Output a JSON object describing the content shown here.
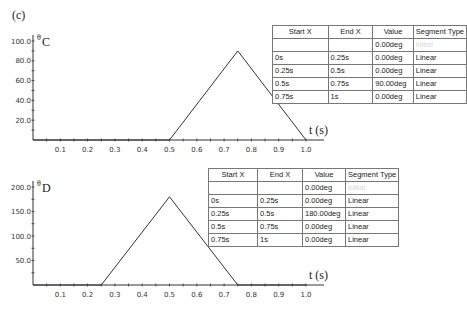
{
  "figure_label": "(c)",
  "charts": [
    {
      "id": "C",
      "y_symbol": "θ",
      "y_subscript": "C",
      "x_label": "t (s)",
      "table": {
        "headers": [
          "Start X",
          "End X",
          "Value",
          "Segment Type"
        ],
        "rows": [
          [
            "",
            "",
            "0.00deg",
            "initial"
          ],
          [
            "0s",
            "0.25s",
            "0.00deg",
            "Linear"
          ],
          [
            "0.25s",
            "0.5s",
            "0.00deg",
            "Linear"
          ],
          [
            "0.5s",
            "0.75s",
            "90.00deg",
            "Linear"
          ],
          [
            "0.75s",
            "1s",
            "0.00deg",
            "Linear"
          ]
        ]
      }
    },
    {
      "id": "D",
      "y_symbol": "θ",
      "y_subscript": "D",
      "x_label": "t (s)",
      "table": {
        "headers": [
          "Start X",
          "End X",
          "Value",
          "Segment Type"
        ],
        "rows": [
          [
            "",
            "",
            "0.00deg",
            "initial"
          ],
          [
            "0s",
            "0.25s",
            "0.00deg",
            "Linear"
          ],
          [
            "0.25s",
            "0.5s",
            "180.00deg",
            "Linear"
          ],
          [
            "0.5s",
            "0.75s",
            "0.00deg",
            "Linear"
          ],
          [
            "0.75s",
            "1s",
            "0.00deg",
            "Linear"
          ]
        ]
      }
    }
  ],
  "chart_data": [
    {
      "type": "line",
      "title": "θC",
      "xlabel": "t (s)",
      "ylabel": "θC",
      "x": [
        0,
        0.25,
        0.5,
        0.75,
        1.0
      ],
      "series": [
        {
          "name": "θC",
          "values": [
            0,
            0,
            0,
            90,
            0
          ]
        }
      ],
      "x_ticks": [
        "0.1",
        "0.2",
        "0.3",
        "0.4",
        "0.5",
        "0.6",
        "0.7",
        "0.8",
        "0.9",
        "1.0"
      ],
      "y_ticks": [
        "20.0",
        "40.0",
        "60.0",
        "80.0",
        "100.0"
      ],
      "xlim": [
        0,
        1.0
      ],
      "ylim": [
        0,
        100
      ],
      "grid": false
    },
    {
      "type": "line",
      "title": "θD",
      "xlabel": "t (s)",
      "ylabel": "θD",
      "x": [
        0,
        0.25,
        0.5,
        0.75,
        1.0
      ],
      "series": [
        {
          "name": "θD",
          "values": [
            0,
            0,
            180,
            0,
            0
          ]
        }
      ],
      "x_ticks": [
        "0.1",
        "0.2",
        "0.3",
        "0.4",
        "0.5",
        "0.6",
        "0.7",
        "0.8",
        "0.9",
        "1.0"
      ],
      "y_ticks": [
        "50.0",
        "100.0",
        "150.0",
        "200.0"
      ],
      "xlim": [
        0,
        1.0
      ],
      "ylim": [
        0,
        200
      ],
      "grid": false
    }
  ]
}
